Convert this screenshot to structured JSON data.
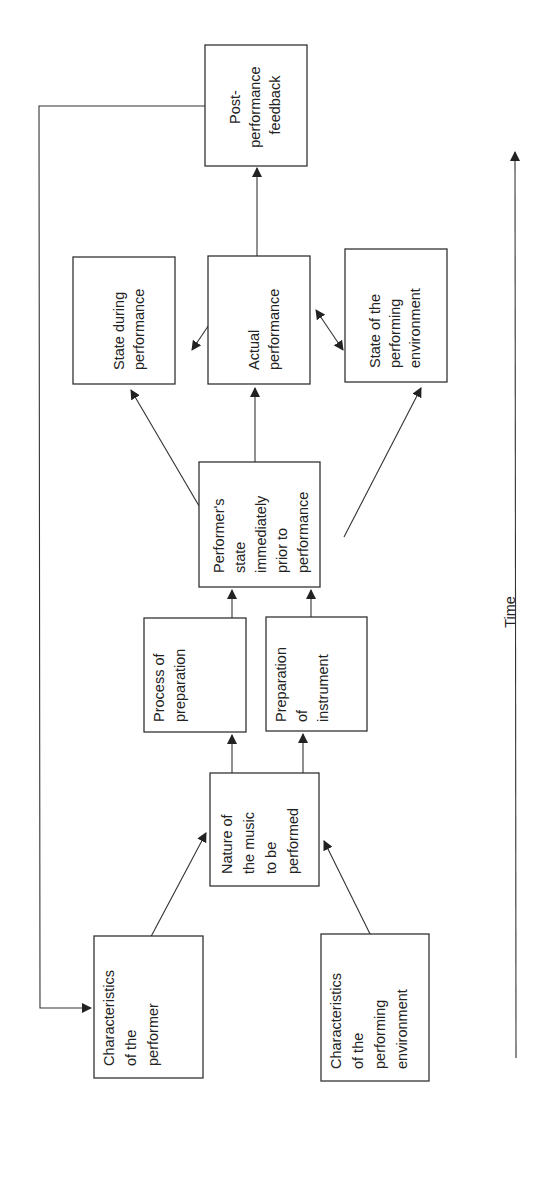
{
  "diagram": {
    "boxes": {
      "post_feedback": {
        "lines": [
          "Post-",
          "performance",
          "feedback"
        ]
      },
      "state_during": {
        "lines": [
          "State during",
          "performance"
        ]
      },
      "actual": {
        "lines": [
          "Actual",
          "performance"
        ]
      },
      "state_env": {
        "lines": [
          "State of the",
          "performing",
          "environment"
        ]
      },
      "performer_state": {
        "lines": [
          "Performer's",
          "state",
          "immediately",
          "prior to",
          "performance"
        ]
      },
      "process_prep": {
        "lines": [
          "Process of",
          "preparation"
        ]
      },
      "prep_instrument": {
        "lines": [
          "Preparation",
          "of",
          "instrument"
        ]
      },
      "nature_music": {
        "lines": [
          "Nature of",
          "the music",
          "to be",
          "performed"
        ]
      },
      "char_performer": {
        "lines": [
          "Characteristics",
          "of the",
          "performer"
        ]
      },
      "char_env": {
        "lines": [
          "Characteristics",
          "of the",
          "performing",
          "environment"
        ]
      }
    },
    "time_axis": {
      "label": "Time"
    }
  }
}
